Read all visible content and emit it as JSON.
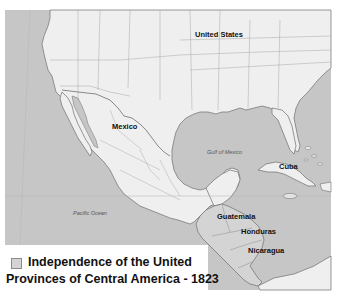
{
  "map": {
    "colors": {
      "ocean": "#c6c6c6",
      "land": "#efefef",
      "highlight_region": "#d4d4d4",
      "border": "#9a9a9a",
      "coast": "#6e6e6e",
      "background": "#ffffff"
    },
    "labels": {
      "united_states": "United States",
      "mexico": "Mexico",
      "cuba": "Cuba",
      "guatemala": "Guatemala",
      "honduras": "Honduras",
      "nicaragua": "Nicaragua"
    },
    "water_labels": {
      "gulf_of_mexico": "Gulf of Mexico",
      "pacific_ocean": "Pacific Ocean"
    }
  },
  "legend": {
    "line1": "Independence of the United",
    "line2": "Provinces of Central America - 1823",
    "swatch_color": "#d4d4d4"
  }
}
